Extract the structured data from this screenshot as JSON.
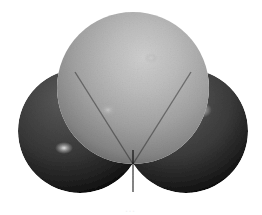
{
  "figure": {
    "kind": "space-filling-molecular-model",
    "background_color": "#ffffff",
    "width": 262,
    "height": 215,
    "caption_remnant": "…"
  },
  "atoms": [
    {
      "id": "atom-central-top",
      "label": "central atom",
      "role": "central",
      "position": "top-center",
      "center_x": 133,
      "center_y": 88,
      "radius": 76,
      "shade": "light-gray",
      "base_color": "#9a9a9a",
      "highlight_color": "#c9c9c9",
      "shadow_color": "#5e5e5e",
      "highlight_x": 150,
      "highlight_y": 55,
      "specular_points": [
        {
          "x": 151,
          "y": 58,
          "rx": 7,
          "ry": 5,
          "color": "#bdbdbd"
        },
        {
          "x": 108,
          "y": 110,
          "rx": 9,
          "ry": 7,
          "color": "#b4b4b4"
        }
      ]
    },
    {
      "id": "atom-left",
      "label": "left terminal atom",
      "role": "terminal",
      "position": "bottom-left",
      "center_x": 80,
      "center_y": 131,
      "radius": 62,
      "shade": "dark-gray",
      "base_color": "#3a3a3a",
      "highlight_color": "#565656",
      "shadow_color": "#0c0c0c",
      "highlight_x": 64,
      "highlight_y": 104,
      "specular_points": [
        {
          "x": 64,
          "y": 148,
          "rx": 9,
          "ry": 6,
          "color": "#d8d8d8"
        }
      ]
    },
    {
      "id": "atom-right",
      "label": "right terminal atom",
      "role": "terminal",
      "position": "bottom-right",
      "center_x": 186,
      "center_y": 131,
      "radius": 62,
      "shade": "dark-gray",
      "base_color": "#3f3f3f",
      "highlight_color": "#5c5c5c",
      "shadow_color": "#0c0c0c",
      "highlight_x": 172,
      "highlight_y": 104,
      "specular_points": [
        {
          "x": 201,
          "y": 110,
          "rx": 11,
          "ry": 8,
          "color": "#d0d0d0"
        },
        {
          "x": 163,
          "y": 147,
          "rx": 8,
          "ry": 5,
          "color": "#d6d6d6"
        }
      ]
    }
  ],
  "palette": {
    "background": "#ffffff",
    "central_light": "#c9c9c9",
    "central_mid": "#9a9a9a",
    "central_dark": "#5e5e5e",
    "terminal_light": "#585858",
    "terminal_mid": "#363636",
    "terminal_dark": "#080808",
    "specular": "#e8e8e8"
  }
}
